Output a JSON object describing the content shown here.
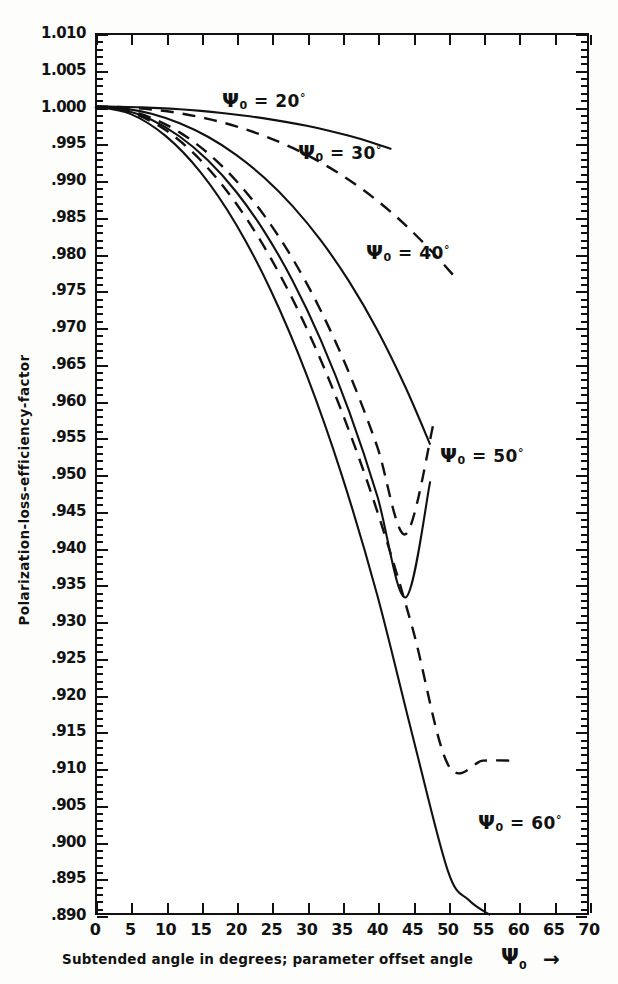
{
  "chart_data": {
    "type": "line",
    "title": "",
    "xlabel": "Subtended angle in degrees; parameter offset angle",
    "xlabel_symbol": "Ψ",
    "xlabel_symbol_sub": "0",
    "xlabel_arrow": "→",
    "ylabel": "Polarization-loss-efficiency-factor",
    "xlim": [
      0,
      70
    ],
    "ylim": [
      0.89,
      1.01
    ],
    "xticks": [
      0,
      5,
      10,
      15,
      20,
      25,
      30,
      35,
      40,
      45,
      50,
      55,
      60,
      65,
      70
    ],
    "xtick_labels": [
      "0",
      "5",
      "10",
      "15",
      "20",
      "25",
      "30",
      "35",
      "40",
      "45",
      "50",
      "55",
      "60",
      "65",
      "70"
    ],
    "yticks": [
      1.01,
      1.005,
      1.0,
      0.995,
      0.99,
      0.985,
      0.98,
      0.975,
      0.97,
      0.965,
      0.96,
      0.955,
      0.95,
      0.945,
      0.94,
      0.935,
      0.93,
      0.925,
      0.92,
      0.915,
      0.91,
      0.905,
      0.9,
      0.895,
      0.89
    ],
    "ytick_labels": [
      "1.010",
      "1.005",
      "1.000",
      ".995",
      ".990",
      ".985",
      ".980",
      ".975",
      ".970",
      ".965",
      ".960",
      ".955",
      ".950",
      ".945",
      ".940",
      ".935",
      ".930",
      ".925",
      ".920",
      ".915",
      ".910",
      ".905",
      ".900",
      ".895",
      ".890"
    ],
    "y_minor_step": 0.001,
    "grid": false,
    "legend_position": "inline-annotations",
    "series": [
      {
        "name": "Ψ0 = 20° (solid)",
        "style": "solid",
        "x": [
          0,
          3,
          6,
          9,
          12,
          15,
          18,
          21,
          24,
          27,
          30,
          33,
          36,
          39,
          42
        ],
        "values": [
          1.0,
          0.99997,
          0.9999,
          0.99978,
          0.99962,
          0.9994,
          0.99912,
          0.99878,
          0.99838,
          0.99791,
          0.99737,
          0.99674,
          0.99601,
          0.99518,
          0.99422
        ]
      },
      {
        "name": "Ψ0 = 30° (dashed)",
        "style": "dashed",
        "x": [
          0,
          4,
          8,
          12,
          16,
          20,
          24,
          28,
          32,
          36,
          40,
          44,
          48,
          51
        ],
        "values": [
          1.0,
          0.9999,
          0.9996,
          0.99908,
          0.99832,
          0.9973,
          0.99599,
          0.99436,
          0.99238,
          0.99,
          0.98718,
          0.98386,
          0.98,
          0.9768
        ]
      },
      {
        "name": "Ψ0 = 40° (solid)",
        "style": "solid",
        "x": [
          0,
          4,
          8,
          12,
          16,
          20,
          24,
          28,
          32,
          36,
          40,
          44,
          47.5
        ],
        "values": [
          1.0,
          0.99975,
          0.999,
          0.99772,
          0.99588,
          0.99342,
          0.9903,
          0.98645,
          0.98178,
          0.9762,
          0.9696,
          0.9618,
          0.954
        ]
      },
      {
        "name": "Ψ0 = 50° (dashed)",
        "style": "dashed",
        "x": [
          0,
          4,
          8,
          12,
          16,
          20,
          24,
          28,
          32,
          36,
          40,
          44,
          48
        ],
        "values": [
          1.0,
          0.99962,
          0.99845,
          0.99648,
          0.99365,
          0.9899,
          0.98515,
          0.9793,
          0.97222,
          0.96375,
          0.9537,
          0.9418,
          0.957
        ]
      },
      {
        "name": "Ψ0 = 50° solid",
        "style": "solid",
        "x": [
          0,
          4,
          8,
          12,
          16,
          20,
          24,
          28,
          32,
          36,
          40,
          44,
          47.5
        ],
        "values": [
          1.0,
          0.99955,
          0.9982,
          0.99592,
          0.99268,
          0.9884,
          0.98298,
          0.9763,
          0.96822,
          0.95855,
          0.947,
          0.9332,
          0.949
        ]
      },
      {
        "name": "Ψ0 = 60° (dashed)",
        "style": "dashed",
        "x": [
          0,
          5,
          10,
          15,
          20,
          25,
          30,
          35,
          40,
          45,
          50,
          55,
          59
        ],
        "values": [
          1.0,
          0.9992,
          0.9968,
          0.99265,
          0.9868,
          0.9792,
          0.9698,
          0.9584,
          0.9449,
          0.929,
          0.9105,
          0.911,
          0.911
        ]
      },
      {
        "name": "Ψ0 = 60° (solid)",
        "style": "solid",
        "x": [
          0,
          5,
          10,
          15,
          20,
          25,
          30,
          35,
          40,
          45,
          50,
          53,
          56
        ],
        "values": [
          1.0,
          0.999,
          0.996,
          0.991,
          0.98395,
          0.9748,
          0.96345,
          0.94975,
          0.9335,
          0.9144,
          0.896,
          0.892,
          0.89
        ]
      }
    ],
    "annotations": [
      {
        "id": "label-20",
        "symbol": "Ψ",
        "sub": "0",
        "eq": "=",
        "value": "20",
        "deg": "°",
        "x_px": 222,
        "y_px": 88
      },
      {
        "id": "label-30",
        "symbol": "Ψ",
        "sub": "0",
        "eq": "=",
        "value": "30",
        "deg": "°",
        "x_px": 298,
        "y_px": 140
      },
      {
        "id": "label-40",
        "symbol": "Ψ",
        "sub": "0",
        "eq": "=",
        "value": "40",
        "deg": "°",
        "x_px": 366,
        "y_px": 240
      },
      {
        "id": "label-50",
        "symbol": "Ψ",
        "sub": "0",
        "eq": "=",
        "value": "50",
        "deg": "°",
        "x_px": 440,
        "y_px": 443
      },
      {
        "id": "label-60",
        "symbol": "Ψ",
        "sub": "0",
        "eq": "=",
        "value": "60",
        "deg": "°",
        "x_px": 478,
        "y_px": 810
      }
    ]
  }
}
